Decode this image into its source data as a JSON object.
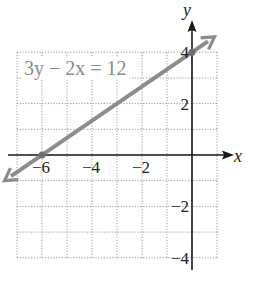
{
  "chart_data": {
    "type": "line",
    "title": "",
    "equation_label": "3y − 2x = 12",
    "xlabel": "x",
    "ylabel": "y",
    "xlim": [
      -7,
      1
    ],
    "ylim": [
      -4,
      4
    ],
    "grid": true,
    "grid_style": "dotted",
    "x_tick_labels": [
      {
        "value": -6,
        "label": "−6"
      },
      {
        "value": -4,
        "label": "−4"
      },
      {
        "value": -2,
        "label": "−2"
      }
    ],
    "y_tick_labels": [
      {
        "value": 4,
        "label": "4"
      },
      {
        "value": 2,
        "label": "2"
      },
      {
        "value": -2,
        "label": "−2"
      },
      {
        "value": -4,
        "label": "−4"
      }
    ],
    "series": [
      {
        "name": "3y − 2x = 12",
        "slope": 0.6667,
        "intercept": 4,
        "x_intercept": -6,
        "y_intercept": 4,
        "points": [
          {
            "x": -7.5,
            "y": -1
          },
          {
            "x": -6,
            "y": 0
          },
          {
            "x": -3,
            "y": 2
          },
          {
            "x": 0,
            "y": 4
          },
          {
            "x": 0.9,
            "y": 4.6
          }
        ],
        "color": "#8c8c8c",
        "arrows_both_ends": true
      }
    ],
    "highlighted_points": [
      {
        "x": -6,
        "y": 0
      },
      {
        "x": 0,
        "y": 4
      }
    ]
  },
  "colors": {
    "axis": "#1a1a1a",
    "grid": "#9a9a9a",
    "line": "#8c8c8c",
    "text": "#222222",
    "equation": "#8a8a8a"
  }
}
